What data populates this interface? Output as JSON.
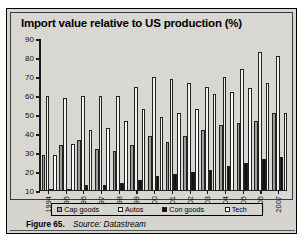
{
  "figure": {
    "label": "Figure 65.",
    "source": "Source: Datastream"
  },
  "chart_data": {
    "type": "bar",
    "title": "Import value relative to US production (%)",
    "xlabel": "",
    "ylabel": "",
    "ylim": [
      10,
      90
    ],
    "yticks": [
      10,
      20,
      30,
      40,
      50,
      60,
      70,
      80,
      90
    ],
    "grid": false,
    "legend_position": "bottom",
    "categories": [
      "1994",
      "1995",
      "1996",
      "1997",
      "1998",
      "1999",
      "2000",
      "2001",
      "2002",
      "2003",
      "2004",
      "2005",
      "2006",
      "2007"
    ],
    "series": [
      {
        "name": "Cap goods",
        "color": "#9d9d9d",
        "values": [
          29,
          34,
          37,
          32,
          31,
          34,
          39,
          36,
          39,
          42,
          45,
          46,
          47,
          51
        ]
      },
      {
        "name": "Autos",
        "color": "#f2f2ef",
        "values": [
          60,
          59,
          60,
          60,
          60,
          65,
          70,
          69,
          67,
          65,
          70,
          74,
          83,
          81
        ]
      },
      {
        "name": "Con goods",
        "color": "#111111",
        "values": [
          11,
          11,
          13,
          13,
          14,
          16,
          18,
          19,
          20,
          21,
          23,
          25,
          27,
          28
        ]
      },
      {
        "name": "Tech",
        "color": "#fbfbf9",
        "values": [
          29,
          35,
          42,
          43,
          47,
          53,
          49,
          51,
          53,
          61,
          62,
          64,
          67,
          51
        ]
      }
    ]
  },
  "legend": {
    "items": [
      {
        "label": "Cap goods"
      },
      {
        "label": "Autos"
      },
      {
        "label": "Con goods"
      },
      {
        "label": "Tech"
      }
    ]
  }
}
